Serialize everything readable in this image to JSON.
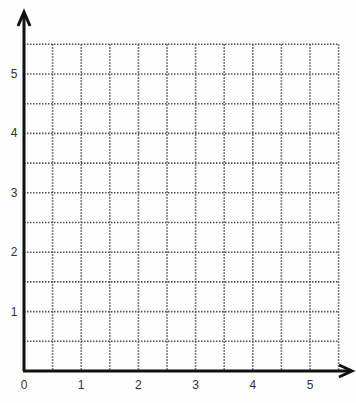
{
  "chart_data": {
    "type": "grid",
    "title": "",
    "xlabel": "",
    "ylabel": "",
    "x_ticks": [
      "0",
      "1",
      "2",
      "3",
      "4",
      "5"
    ],
    "y_ticks": [
      "1",
      "2",
      "3",
      "4",
      "5"
    ],
    "xlim": [
      0,
      5.5
    ],
    "ylim": [
      0,
      5.5
    ],
    "grid": {
      "on": true,
      "step": 0.5,
      "style": "dotted"
    },
    "axis_arrows": true,
    "points": []
  },
  "colors": {
    "axis": "#111111",
    "grid": "#555555",
    "label": "#333333",
    "background": "#fdfdfd"
  }
}
